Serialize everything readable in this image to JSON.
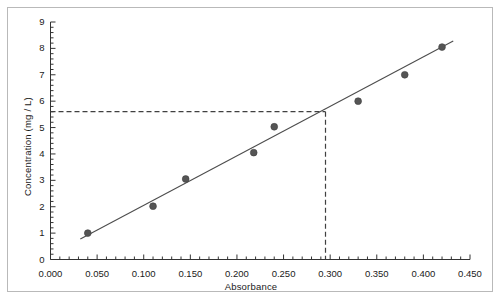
{
  "chart_data": {
    "type": "scatter",
    "title": "",
    "xlabel": "Absorbance",
    "ylabel": "Concentration (mg / L)",
    "xlim": [
      0.0,
      0.45
    ],
    "ylim": [
      0,
      9
    ],
    "grid": false,
    "legend": "none",
    "xticks": [
      0.0,
      0.05,
      0.1,
      0.15,
      0.2,
      0.25,
      0.3,
      0.35,
      0.4,
      0.45
    ],
    "xtick_labels": [
      "0.000",
      "0.050",
      "0.100",
      "0.150",
      "0.200",
      "0.250",
      "0.300",
      "0.350",
      "0.400",
      "0.450"
    ],
    "yticks": [
      0,
      1,
      2,
      3,
      4,
      5,
      6,
      7,
      8,
      9
    ],
    "ytick_labels": [
      "0",
      "1",
      "2",
      "3",
      "4",
      "5",
      "6",
      "7",
      "8",
      "9"
    ],
    "x_minor_per_major": 5,
    "y_minor_per_major": 5,
    "series": [
      {
        "name": "Calibration standards",
        "type": "scatter",
        "marker": "circle",
        "color": "#555555",
        "x": [
          0.04,
          0.11,
          0.145,
          0.218,
          0.24,
          0.33,
          0.38,
          0.42
        ],
        "y": [
          1.0,
          2.02,
          3.05,
          4.05,
          5.03,
          6.0,
          7.0,
          8.05
        ]
      },
      {
        "name": "Best fit line",
        "type": "line",
        "color": "#4d4d4d",
        "x": [
          0.032,
          0.432
        ],
        "y": [
          0.78,
          8.28
        ]
      }
    ],
    "annotations": [
      {
        "name": "interpolation-guide",
        "style": "dashed",
        "color": "#404040",
        "x_value": 0.295,
        "y_value": 5.6,
        "horizontal_from_x": 0.0,
        "vertical_to_y": 0.0
      }
    ]
  },
  "axes": {
    "x_title": "Absorbance",
    "y_title": "Concentration (mg / L)"
  }
}
